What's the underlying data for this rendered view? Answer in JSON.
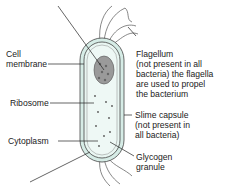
{
  "diagram": {
    "colors": {
      "cytoplasm": "#e4f3ef",
      "capsule": "#cfe8e2",
      "outline": "#333333",
      "nucleoid": "#777777"
    },
    "labels": {
      "cell_membrane": [
        "Cell",
        "membrane"
      ],
      "ribosome": "Ribosome",
      "cytoplasm": "Cytoplasm",
      "flagellum": [
        "Flagellum",
        "(not present in all",
        "bacteria) the flagella",
        "are used to propel",
        "the bacterium"
      ],
      "slime_capsule": [
        "Slime capsule",
        "(not present in",
        "all bacteria)"
      ],
      "glycogen": [
        "Glycogen",
        "granule"
      ]
    }
  }
}
